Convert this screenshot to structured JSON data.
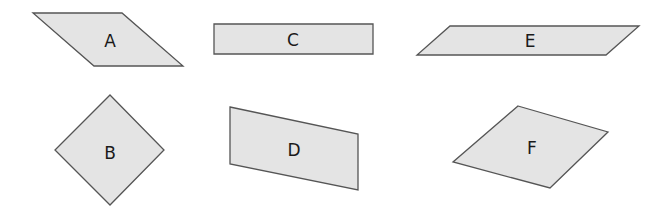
{
  "colors": {
    "fill": "#e4e4e4",
    "stroke": "#555555",
    "text": "#1a1a1a"
  },
  "shapes": [
    {
      "id": "A",
      "label": "A",
      "points": "33,13 122,13 183,66 94,66",
      "label_x": 110,
      "label_y": 41
    },
    {
      "id": "C",
      "label": "C",
      "points": "214,24 373,24 373,54 214,54",
      "label_x": 293,
      "label_y": 40
    },
    {
      "id": "E",
      "label": "E",
      "points": "450,26 639,26 606,55 417,55",
      "label_x": 530,
      "label_y": 41
    },
    {
      "id": "B",
      "label": "B",
      "points": "110,95 164,150 110,205 55,150",
      "label_x": 110,
      "label_y": 153
    },
    {
      "id": "D",
      "label": "D",
      "points": "230,107 358,134 358,190 230,164",
      "label_x": 294,
      "label_y": 150
    },
    {
      "id": "F",
      "label": "F",
      "points": "518,106 608,132 550,188 453,162",
      "label_x": 532,
      "label_y": 148
    }
  ]
}
